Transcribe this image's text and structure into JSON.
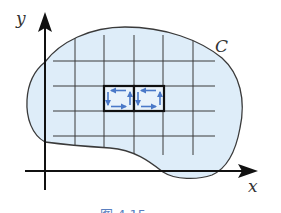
{
  "figure": {
    "axis_x_label": "x",
    "axis_y_label": "y",
    "curve_label": "C",
    "caption": "图 4.15",
    "colors": {
      "region_fill": "#deedf9",
      "curve_stroke": "#3a3a3a",
      "grid_stroke": "#3a3a3a",
      "axis_stroke": "#111111",
      "highlight_box_stroke": "#111111",
      "circulation_arrow": "#4a78c8",
      "caption": "#5a7fc0"
    },
    "grid": {
      "vertical_lines_x": [
        75,
        104,
        134,
        163,
        193
      ],
      "horizontal_lines_y": [
        61,
        86,
        111,
        136
      ]
    },
    "highlighted_cells": [
      {
        "x": 104,
        "y": 86,
        "w": 30,
        "h": 25,
        "circulation": "counterclockwise"
      },
      {
        "x": 134,
        "y": 86,
        "w": 30,
        "h": 25,
        "circulation": "counterclockwise"
      }
    ]
  }
}
